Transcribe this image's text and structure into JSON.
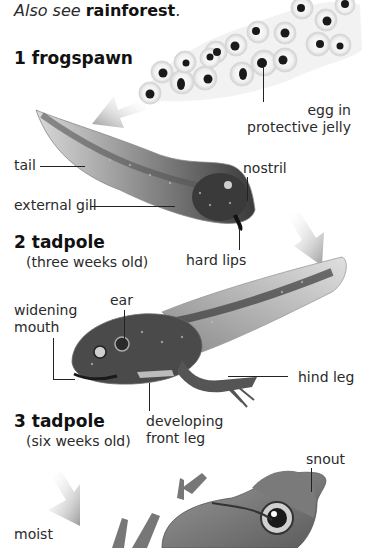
{
  "header": {
    "see_also_prefix": "Also see",
    "see_also_link": "rainforest",
    "see_also_suffix": "."
  },
  "stages": [
    {
      "number": "1",
      "title": "frogspawn",
      "subtitle": ""
    },
    {
      "number": "2",
      "title": "tadpole",
      "subtitle": "(three weeks old)"
    },
    {
      "number": "3",
      "title": "tadpole",
      "subtitle": "(six weeks old)"
    }
  ],
  "labels": {
    "egg_in": "egg in",
    "protective_jelly": "protective jelly",
    "tail": "tail",
    "nostril": "nostril",
    "external_gill": "external gill",
    "hard_lips": "hard lips",
    "widening": "widening",
    "mouth": "mouth",
    "ear": "ear",
    "hind_leg": "hind leg",
    "developing": "developing",
    "front_leg": "front leg",
    "snout": "snout",
    "moist": "moist"
  },
  "colors": {
    "text": "#2a2a2a",
    "arrow": "#9a9a9a",
    "leader_line": "#222222"
  }
}
